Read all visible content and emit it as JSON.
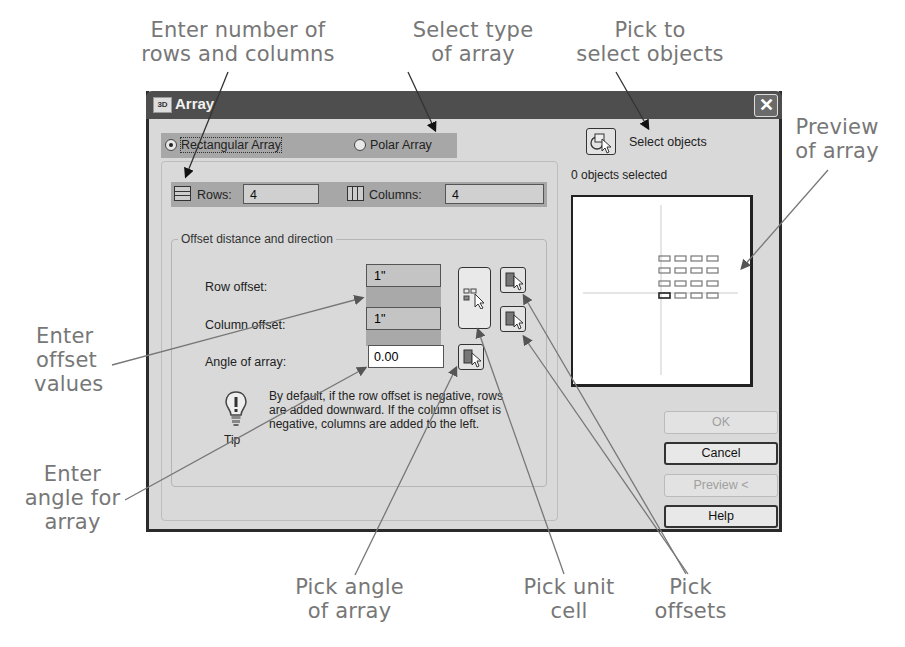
{
  "top_text": "by using the Rectangular or Polar Array option, and select objects to array. You can also",
  "dialog": {
    "title": "Array",
    "close_label": "✕",
    "array_type": {
      "rectangular_label": "Rectangular Array",
      "polar_label": "Polar Array",
      "selected": "Rectangular Array"
    },
    "rows_label": "Rows:",
    "rows_value": "4",
    "columns_label": "Columns:",
    "columns_value": "4",
    "offset_group_label": "Offset distance and direction",
    "row_offset_label": "Row offset:",
    "row_offset_value": "1\"",
    "column_offset_label": "Column offset:",
    "column_offset_value": "1\"",
    "angle_label": "Angle of array:",
    "angle_value": "0.00",
    "tip_label": "Tip",
    "tip_text": "By default, if the row offset is negative, rows are added downward. If the column offset is negative, columns are added to the left.",
    "select_objects_label": "Select objects",
    "objects_selected": "0 objects selected",
    "buttons": {
      "ok": "OK",
      "cancel": "Cancel",
      "preview": "Preview <",
      "help": "Help"
    },
    "preview": {
      "rows": 4,
      "columns": 4
    }
  },
  "callouts": {
    "rows_cols": [
      "Enter number of",
      "rows and columns"
    ],
    "type": [
      "Select type",
      "of array"
    ],
    "select": [
      "Pick to",
      "select objects"
    ],
    "preview": [
      "Preview",
      "of array"
    ],
    "offset": [
      "Enter",
      "offset",
      "values"
    ],
    "angle": [
      "Enter",
      "angle for",
      "array"
    ],
    "pick_angle": [
      "Pick angle",
      "of array"
    ],
    "pick_unit": [
      "Pick unit",
      "cell"
    ],
    "pick_offsets": [
      "Pick",
      "offsets"
    ]
  }
}
